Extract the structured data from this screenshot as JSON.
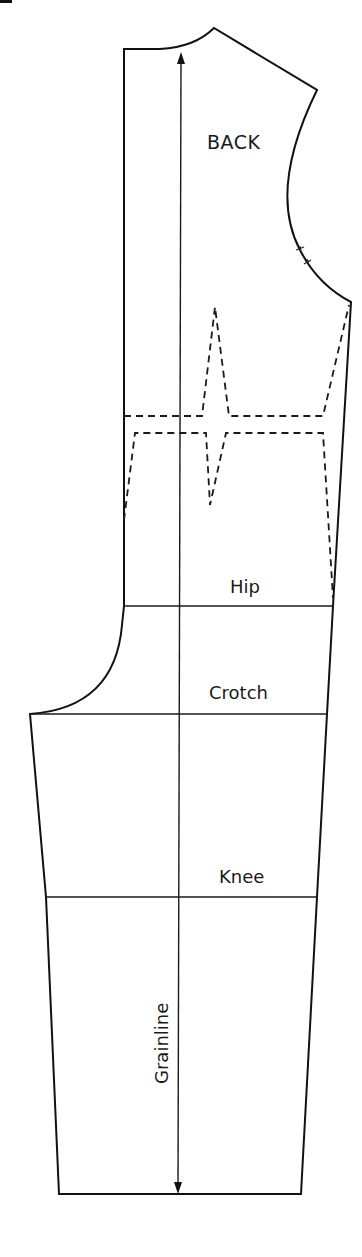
{
  "diagram": {
    "type": "sewing-pattern",
    "piece_name": "BACK",
    "labels": {
      "piece": "BACK",
      "hip": "Hip",
      "crotch": "Crotch",
      "knee": "Knee",
      "grainline": "Grainline"
    },
    "guide_lines": [
      {
        "name": "hip-line",
        "label": "Hip"
      },
      {
        "name": "crotch-line",
        "label": "Crotch"
      },
      {
        "name": "knee-line",
        "label": "Knee"
      }
    ],
    "markings": {
      "grainline_arrow": "double-headed vertical arrow",
      "armhole_notches": 2,
      "waist_darts": "dashed waist seam with vertical darts"
    },
    "colors": {
      "line": "#111111",
      "background": "#ffffff"
    }
  }
}
